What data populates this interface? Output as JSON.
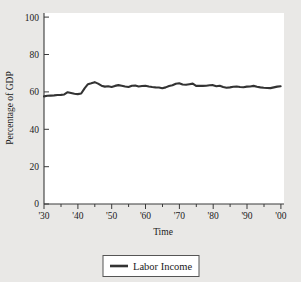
{
  "figure": {
    "background_color": "#e9e8e6",
    "plot_background_color": "#ffffff",
    "line_color": "#333333",
    "axis_color": "#3a3a3a"
  },
  "legend": {
    "position": "bottom-center",
    "entries": [
      {
        "label": "Labor Income",
        "color": "#333333"
      }
    ]
  },
  "chart_data": {
    "type": "line",
    "title": "",
    "xlabel": "Time",
    "ylabel": "Percentage of GDP",
    "xlim": [
      1930,
      2001
    ],
    "ylim": [
      0,
      100
    ],
    "grid": false,
    "legend_position": "bottom-center",
    "y_ticks": [
      0,
      20,
      40,
      60,
      80,
      100
    ],
    "y_ticklabels": [
      "0",
      "20",
      "40",
      "60",
      "80",
      "100"
    ],
    "x_ticks": [
      1930,
      1940,
      1950,
      1960,
      1970,
      1980,
      1990,
      2000
    ],
    "x_ticklabels": [
      "'30",
      "'40",
      "'50",
      "'60",
      "'70",
      "'80",
      "'90",
      "'00"
    ],
    "x_minor_tick_interval": 5,
    "series": [
      {
        "name": "Labor Income",
        "color": "#333333",
        "x": [
          1930,
          1931,
          1932,
          1933,
          1934,
          1935,
          1936,
          1937,
          1938,
          1939,
          1940,
          1941,
          1942,
          1943,
          1944,
          1945,
          1946,
          1947,
          1948,
          1949,
          1950,
          1951,
          1952,
          1953,
          1954,
          1955,
          1956,
          1957,
          1958,
          1959,
          1960,
          1961,
          1962,
          1963,
          1964,
          1965,
          1966,
          1967,
          1968,
          1969,
          1970,
          1971,
          1972,
          1973,
          1974,
          1975,
          1976,
          1977,
          1978,
          1979,
          1980,
          1981,
          1982,
          1983,
          1984,
          1985,
          1986,
          1987,
          1988,
          1989,
          1990,
          1991,
          1992,
          1993,
          1994,
          1995,
          1996,
          1997,
          1998,
          1999,
          2000
        ],
        "values": [
          57.6,
          57.9,
          58.0,
          58.1,
          58.3,
          58.4,
          58.6,
          59.8,
          59.4,
          59.0,
          58.8,
          59.1,
          61.9,
          64.1,
          64.6,
          65.2,
          64.4,
          63.3,
          62.8,
          63.0,
          62.6,
          63.2,
          63.6,
          63.3,
          62.9,
          62.6,
          63.3,
          63.4,
          62.9,
          63.1,
          63.3,
          62.9,
          62.6,
          62.4,
          62.3,
          61.9,
          62.4,
          63.1,
          63.5,
          64.3,
          64.6,
          63.9,
          63.8,
          64.1,
          64.4,
          63.2,
          63.3,
          63.2,
          63.3,
          63.5,
          63.6,
          63.0,
          63.3,
          62.6,
          62.2,
          62.4,
          62.7,
          62.9,
          62.6,
          62.5,
          62.8,
          62.9,
          63.2,
          62.7,
          62.4,
          62.2,
          62.1,
          62.0,
          62.4,
          62.8,
          63.0
        ]
      }
    ]
  }
}
